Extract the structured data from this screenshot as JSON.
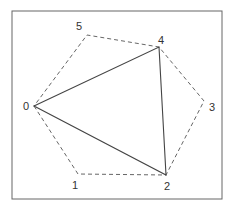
{
  "diagram": {
    "frame": {
      "x": 12,
      "y": 11,
      "width": 210,
      "height": 188,
      "stroke": "#666666"
    },
    "vertices": [
      {
        "id": "0",
        "label": "0",
        "x": 34,
        "y": 106,
        "lx": 23,
        "ly": 110
      },
      {
        "id": "1",
        "label": "1",
        "x": 78,
        "y": 174,
        "lx": 72,
        "ly": 189
      },
      {
        "id": "2",
        "label": "2",
        "x": 166,
        "y": 175,
        "lx": 164,
        "ly": 190
      },
      {
        "id": "3",
        "label": "3",
        "x": 204,
        "y": 101,
        "lx": 209,
        "ly": 111
      },
      {
        "id": "4",
        "label": "4",
        "x": 159,
        "y": 47,
        "lx": 158,
        "ly": 44
      },
      {
        "id": "5",
        "label": "5",
        "x": 87,
        "y": 35,
        "lx": 76,
        "ly": 30
      }
    ],
    "hexagon": {
      "order": [
        0,
        1,
        2,
        3,
        4,
        5
      ],
      "style": "dashed",
      "stroke": "#666666"
    },
    "triangle": {
      "order": [
        0,
        4,
        2
      ],
      "style": "solid",
      "stroke": "#444444"
    }
  }
}
